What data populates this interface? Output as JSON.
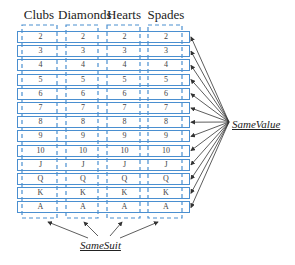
{
  "headers": [
    "Clubs",
    "Diamonds",
    "Hearts",
    "Spades"
  ],
  "values": [
    "2",
    "3",
    "4",
    "5",
    "6",
    "7",
    "8",
    "9",
    "10",
    "J",
    "Q",
    "K",
    "A"
  ],
  "labels": {
    "same_value": "SameValue",
    "same_suit": "SameSuit"
  },
  "colors": {
    "box": "#4a8fd0",
    "arrow": "#333333",
    "text": "#222222"
  }
}
